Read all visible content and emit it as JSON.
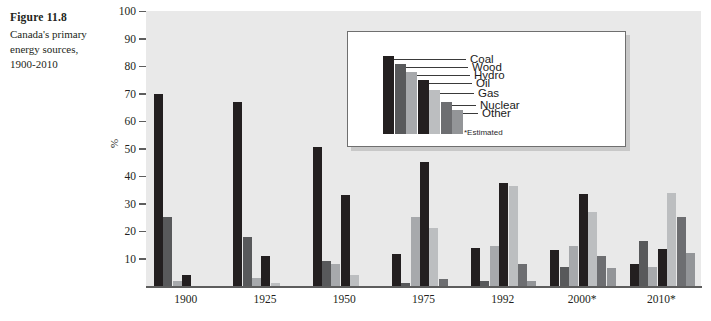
{
  "caption": {
    "figure_number": "Figure 11.8",
    "description": "Canada's primary energy sources, 1900-2010"
  },
  "chart_data": {
    "type": "bar",
    "title": "Canada's primary energy sources, 1900-2010",
    "xlabel": "",
    "ylabel": "%",
    "ylim": [
      0,
      100
    ],
    "ytick_labels": [
      "100",
      "90",
      "80",
      "70",
      "60",
      "50",
      "40",
      "30",
      "20",
      "10"
    ],
    "yticks": [
      100,
      90,
      80,
      70,
      60,
      50,
      40,
      30,
      20,
      10
    ],
    "grid": false,
    "legend_position": "inset-top-center",
    "categories": [
      "1900",
      "1925",
      "1950",
      "1975",
      "1992",
      "2000*",
      "2010*"
    ],
    "series": [
      {
        "name": "Coal",
        "color": "#231f20",
        "values": [
          70,
          67,
          50.5,
          11.5,
          14,
          13,
          8
        ]
      },
      {
        "name": "Wood",
        "color": "#58595b",
        "values": [
          25,
          18,
          9,
          1,
          2,
          7,
          16.5
        ]
      },
      {
        "name": "Hydro",
        "color": "#a7a9ac",
        "values": [
          2,
          3,
          8,
          25,
          14.5,
          14.5,
          7
        ]
      },
      {
        "name": "Oil",
        "color": "#231f20",
        "values": [
          4,
          11,
          33,
          45,
          37.5,
          33.5,
          13.5
        ]
      },
      {
        "name": "Gas",
        "color": "#bcbec0",
        "values": [
          0,
          1,
          4,
          21,
          36.5,
          27,
          34
        ]
      },
      {
        "name": "Nuclear",
        "color": "#6d6e71",
        "values": [
          0,
          0,
          0,
          2.5,
          8,
          11,
          25
        ]
      },
      {
        "name": "Other",
        "color": "#939598",
        "values": [
          0,
          0,
          0,
          0,
          2,
          6.5,
          12
        ]
      }
    ],
    "legend_note": "*Estimated",
    "legend_entries": [
      "Coal",
      "Wood",
      "Hydro",
      "Oil",
      "Gas",
      "Nuclear",
      "Other"
    ],
    "legend_bar_heights": [
      78,
      70,
      62,
      54,
      44,
      32,
      24
    ],
    "colors": {
      "plot_background": "#e9e9e9",
      "axis": "#5d5d5d",
      "text": "#231f20",
      "legend_background": "#ffffff",
      "legend_border": "#6f6f6f",
      "legend_shadow": "#c8c8c8"
    }
  }
}
